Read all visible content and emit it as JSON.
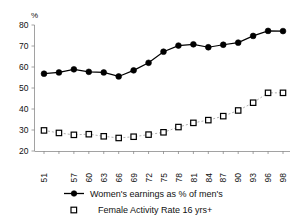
{
  "chart_data": {
    "type": "line",
    "title": "",
    "xlabel": "",
    "ylabel": "%",
    "ylim": [
      20,
      80
    ],
    "yticks": [
      20,
      30,
      40,
      50,
      60,
      70,
      80
    ],
    "ytick_labels": [
      "20",
      "30",
      "40",
      "50",
      "60",
      "70",
      "80"
    ],
    "grid": false,
    "legend_position": "bottom",
    "x": [
      1951,
      1954,
      1957,
      1960,
      1963,
      1966,
      1969,
      1972,
      1975,
      1978,
      1981,
      1984,
      1987,
      1990,
      1993,
      1996,
      1998
    ],
    "categories": [
      "51",
      "",
      "57",
      "60",
      "63",
      "66",
      "69",
      "72",
      "75",
      "78",
      "81",
      "84",
      "87",
      "90",
      "93",
      "96",
      "98"
    ],
    "xtick_labels": [
      "51",
      "57",
      "60",
      "63",
      "66",
      "69",
      "72",
      "75",
      "78",
      "81",
      "84",
      "87",
      "90",
      "93",
      "96",
      "98"
    ],
    "series": [
      {
        "name": "Women's earnings as % of men's",
        "marker": "filled-circle",
        "line_style": "solid",
        "color": "#000000",
        "values": [
          56.8,
          57.4,
          58.9,
          57.7,
          57.4,
          55.5,
          58.4,
          62.0,
          67.3,
          70.2,
          70.8,
          69.4,
          70.6,
          71.6,
          74.8,
          77.2,
          77.1
        ]
      },
      {
        "name": "Female Activity Rate 16 yrs+",
        "marker": "open-square",
        "line_style": "dashed",
        "color": "#9a9a9a",
        "values": [
          29.8,
          28.6,
          27.7,
          28.0,
          27.0,
          26.2,
          26.8,
          27.8,
          28.9,
          31.4,
          33.4,
          34.7,
          36.6,
          39.3,
          43.0,
          47.7,
          47.7
        ]
      }
    ]
  },
  "legend": {
    "entries": [
      {
        "label": "Women's earnings as % of men's",
        "marker": "filled-circle-with-line"
      },
      {
        "label": "Female Activity Rate 16 yrs+",
        "marker": "open-square"
      }
    ]
  },
  "axes": {
    "y_unit": "%"
  }
}
